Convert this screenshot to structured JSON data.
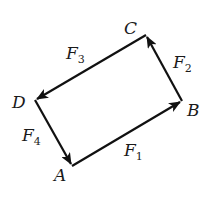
{
  "diagram": {
    "type": "force-vector-quadrilateral",
    "points": {
      "A": {
        "label": "A",
        "x": 72,
        "y": 166
      },
      "B": {
        "label": "B",
        "x": 182,
        "y": 101
      },
      "C": {
        "label": "C",
        "x": 146,
        "y": 35
      },
      "D": {
        "label": "D",
        "x": 35,
        "y": 100
      }
    },
    "vectors": [
      {
        "name": "F1",
        "base": "F",
        "sub": "1",
        "from": "A",
        "to": "B"
      },
      {
        "name": "F2",
        "base": "F",
        "sub": "2",
        "from": "B",
        "to": "C"
      },
      {
        "name": "F3",
        "base": "F",
        "sub": "3",
        "from": "C",
        "to": "D"
      },
      {
        "name": "F4",
        "base": "F",
        "sub": "4",
        "from": "D",
        "to": "A"
      }
    ],
    "colors": {
      "stroke": "#111111",
      "background": "#ffffff"
    }
  }
}
